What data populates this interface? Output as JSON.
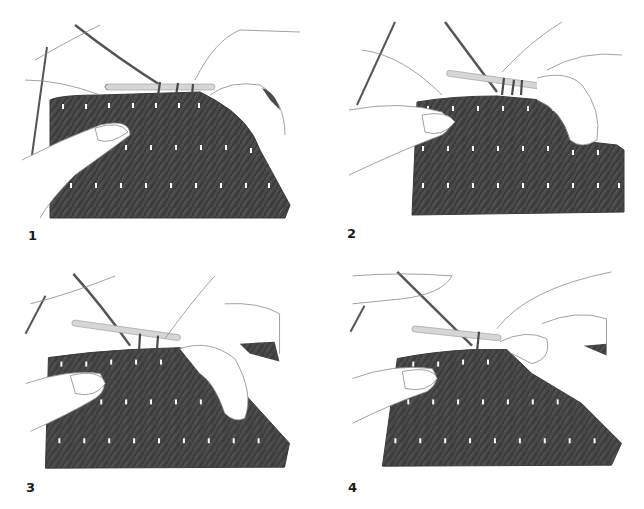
{
  "figure": {
    "colors": {
      "background": "#ffffff",
      "fabric": "#4a4a4a",
      "fabric_dark": "#3a3a3a",
      "stitch_highlight": "#ffffff",
      "yarn": "#555555",
      "hook": "#d6d6d6",
      "outline": "#8a8a8a",
      "label": "#1a1a1a"
    },
    "panels": [
      {
        "step": "1"
      },
      {
        "step": "2"
      },
      {
        "step": "3"
      },
      {
        "step": "4"
      }
    ]
  }
}
